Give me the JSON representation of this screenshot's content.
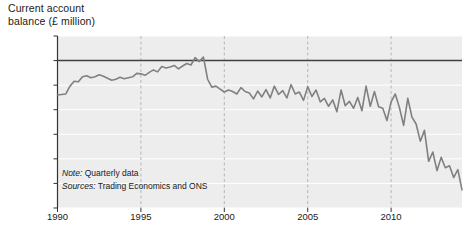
{
  "chart_data": {
    "type": "line",
    "title_line1": "Current account",
    "title_line2": "balance (£ million)",
    "xlabel": "",
    "ylabel": "Current account balance (£ million)",
    "xlim": [
      1990,
      2014.25
    ],
    "ylim": [
      -30000,
      5000
    ],
    "grid": true,
    "grid_x_style": "dashed",
    "grid_y_style": "solid-white",
    "legend": "none",
    "line_color": "#808080",
    "zero_line_color": "#404040",
    "plot_background": "#ededed",
    "ytick_labels": [
      "5000",
      "0",
      "-5000",
      "-10,000",
      "-15,000",
      "-20,000",
      "-25,000",
      "-30,000"
    ],
    "yticks": [
      5000,
      0,
      -5000,
      -10000,
      -15000,
      -20000,
      -25000,
      -30000
    ],
    "xtick_labels": [
      "1990",
      "1995",
      "2000",
      "2005",
      "2010"
    ],
    "xticks": [
      1990,
      1995,
      2000,
      2005,
      2010
    ],
    "notes": [
      {
        "label": "Note:",
        "text": " Quarterly data"
      },
      {
        "label": "Sources:",
        "text": " Trading Economics and ONS"
      }
    ],
    "x": [
      1990.0,
      1990.25,
      1990.5,
      1990.75,
      1991.0,
      1991.25,
      1991.5,
      1991.75,
      1992.0,
      1992.25,
      1992.5,
      1992.75,
      1993.0,
      1993.25,
      1993.5,
      1993.75,
      1994.0,
      1994.25,
      1994.5,
      1994.75,
      1995.0,
      1995.25,
      1995.5,
      1995.75,
      1996.0,
      1996.25,
      1996.5,
      1996.75,
      1997.0,
      1997.25,
      1997.5,
      1997.75,
      1998.0,
      1998.25,
      1998.5,
      1998.75,
      1999.0,
      1999.25,
      1999.5,
      1999.75,
      2000.0,
      2000.25,
      2000.5,
      2000.75,
      2001.0,
      2001.25,
      2001.5,
      2001.75,
      2002.0,
      2002.25,
      2002.5,
      2002.75,
      2003.0,
      2003.25,
      2003.5,
      2003.75,
      2004.0,
      2004.25,
      2004.5,
      2004.75,
      2005.0,
      2005.25,
      2005.5,
      2005.75,
      2006.0,
      2006.25,
      2006.5,
      2006.75,
      2007.0,
      2007.25,
      2007.5,
      2007.75,
      2008.0,
      2008.25,
      2008.5,
      2008.75,
      2009.0,
      2009.25,
      2009.5,
      2009.75,
      2010.0,
      2010.25,
      2010.5,
      2010.75,
      2011.0,
      2011.25,
      2011.5,
      2011.75,
      2012.0,
      2012.25,
      2012.5,
      2012.75,
      2013.0,
      2013.25,
      2013.5,
      2013.75,
      2014.0,
      2014.25
    ],
    "values": [
      -7000,
      -6900,
      -6800,
      -5200,
      -4200,
      -4300,
      -3300,
      -3100,
      -3500,
      -3300,
      -2900,
      -3200,
      -3600,
      -4000,
      -3800,
      -3400,
      -3700,
      -3500,
      -3300,
      -2600,
      -2700,
      -3000,
      -2400,
      -1900,
      -2300,
      -1200,
      -1500,
      -1300,
      -1000,
      -1700,
      -1100,
      -600,
      -900,
      600,
      -200,
      700,
      -3800,
      -5400,
      -5200,
      -5800,
      -6400,
      -6000,
      -6300,
      -6800,
      -5500,
      -6300,
      -6600,
      -7800,
      -6200,
      -7400,
      -5900,
      -7600,
      -5200,
      -6900,
      -6100,
      -7600,
      -4900,
      -6800,
      -6400,
      -8100,
      -5300,
      -7300,
      -6000,
      -8400,
      -7700,
      -9300,
      -8000,
      -10400,
      -6000,
      -9200,
      -8300,
      -9700,
      -7500,
      -10200,
      -5200,
      -9300,
      -6300,
      -9400,
      -9700,
      -12200,
      -8400,
      -6800,
      -9600,
      -13200,
      -7700,
      -11500,
      -12900,
      -16400,
      -14200,
      -20500,
      -18600,
      -22400,
      -19700,
      -21800,
      -21400,
      -23800,
      -22200,
      -26300
    ]
  }
}
